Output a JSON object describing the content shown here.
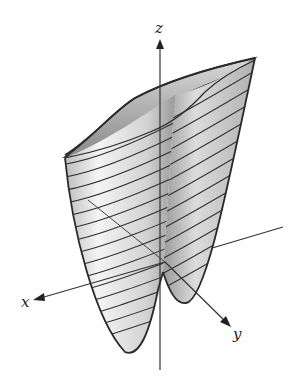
{
  "figure": {
    "type": "3d-surface-plot",
    "colors": {
      "background": "#ffffff",
      "outline": "#2a2a2a",
      "surface_light": "#f2f2f2",
      "surface_mid": "#cfcfcf",
      "surface_dark": "#8c8c8c",
      "trace": "#333333"
    }
  },
  "axes": {
    "x": {
      "label": "x"
    },
    "y": {
      "label": "y"
    },
    "z": {
      "label": "z"
    }
  }
}
